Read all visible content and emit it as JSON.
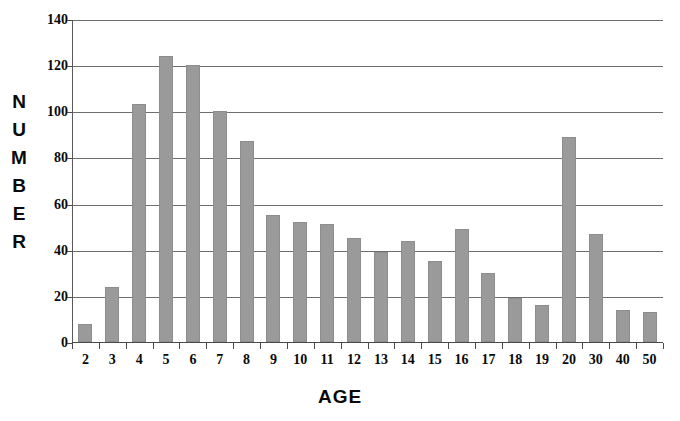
{
  "chart_data": {
    "type": "bar",
    "title": "",
    "xlabel": "AGE",
    "ylabel": "NUMBER",
    "categories": [
      "2",
      "3",
      "4",
      "5",
      "6",
      "7",
      "8",
      "9",
      "10",
      "11",
      "12",
      "13",
      "14",
      "15",
      "16",
      "17",
      "18",
      "19",
      "20",
      "30",
      "40",
      "50"
    ],
    "values": [
      8,
      24,
      103,
      124,
      120,
      100,
      87,
      55,
      52,
      51,
      45,
      39,
      44,
      35,
      49,
      30,
      19,
      16,
      89,
      47,
      14,
      13
    ],
    "ylim": [
      0,
      140
    ],
    "y_ticks": [
      0,
      20,
      40,
      60,
      80,
      100,
      120,
      140
    ],
    "grid": "horizontal",
    "legend": "none",
    "series_color": "#9a9a9a",
    "axis_color": "#4a4a4a",
    "gridline_color": "#6e6e6e",
    "text_color": "#0a0a0a"
  },
  "axes": {
    "y_title_letters": [
      "N",
      "U",
      "M",
      "B",
      "E",
      "R"
    ],
    "y_title_text": "NUMBER",
    "x_title_text": "AGE"
  }
}
